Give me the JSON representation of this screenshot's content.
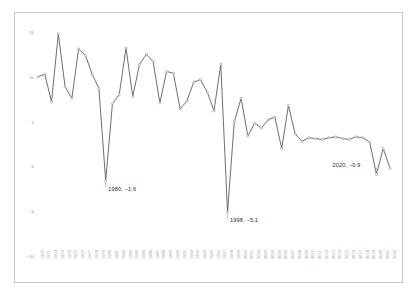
{
  "chart": {
    "background": "#ffffff",
    "frame_color": "#c9c9c9",
    "line_color": "#4a4a4a",
    "marker_color": "#8f8f8f",
    "tick_color": "#8a8a8a"
  },
  "chart_data": {
    "type": "line",
    "title": "",
    "subtitle": "",
    "xlabel": "",
    "ylabel": "",
    "grid": false,
    "legend": "none",
    "xlim": [
      1970,
      2022
    ],
    "ylim": [
      -10,
      15
    ],
    "yticks": [
      15,
      10,
      5,
      0,
      -5,
      -10
    ],
    "ytick_labels": [
      "15",
      "10",
      "5",
      "0",
      "−5",
      "−10"
    ],
    "x": [
      1970,
      1971,
      1972,
      1973,
      1974,
      1975,
      1976,
      1977,
      1978,
      1979,
      1980,
      1981,
      1982,
      1983,
      1984,
      1985,
      1986,
      1987,
      1988,
      1989,
      1990,
      1991,
      1992,
      1993,
      1994,
      1995,
      1996,
      1997,
      1998,
      1999,
      2000,
      2001,
      2002,
      2003,
      2004,
      2005,
      2006,
      2007,
      2008,
      2009,
      2010,
      2011,
      2012,
      2013,
      2014,
      2015,
      2016,
      2017,
      2018,
      2019,
      2020,
      2021,
      2022
    ],
    "categories": [
      "1970",
      "1971",
      "1972",
      "1973",
      "1974",
      "1975",
      "1976",
      "1977",
      "1978",
      "1979",
      "1980",
      "1981",
      "1982",
      "1983",
      "1984",
      "1985",
      "1986",
      "1987",
      "1988",
      "1989",
      "1990",
      "1991",
      "1992",
      "1993",
      "1994",
      "1995",
      "1996",
      "1997",
      "1998",
      "1999",
      "2000",
      "2001",
      "2002",
      "2003",
      "2004",
      "2005",
      "2006",
      "2007",
      "2008",
      "2009",
      "2010",
      "2011",
      "2012",
      "2013",
      "2014",
      "2015",
      "2016",
      "2017",
      "2018",
      "2019",
      "2020",
      "2021",
      "2022"
    ],
    "series": [
      {
        "name": "growth-rate",
        "values": [
          10.0,
          10.3,
          7.2,
          14.8,
          8.9,
          7.6,
          13.1,
          12.4,
          10.3,
          8.7,
          -1.6,
          7.0,
          8.0,
          13.2,
          7.8,
          11.4,
          12.5,
          11.7,
          7.1,
          10.6,
          10.4,
          6.4,
          7.3,
          9.4,
          9.7,
          8.3,
          6.2,
          11.4,
          -5.1,
          5.0,
          7.6,
          3.4,
          4.8,
          4.3,
          5.2,
          5.5,
          2.0,
          6.8,
          3.6,
          2.8,
          3.2,
          3.1,
          3.0,
          3.2,
          3.3,
          3.1,
          3.0,
          3.3,
          3.2,
          2.7,
          -0.9,
          2.0,
          -0.2
        ]
      }
    ],
    "annotations": [
      {
        "label": "1980,  −1.6",
        "x": 1980,
        "y": -1.6
      },
      {
        "label": "1998,  −5.1",
        "x": 1998,
        "y": -5.1
      },
      {
        "label": "2020,  −0.9",
        "x": 2020,
        "y": -0.9
      }
    ]
  }
}
